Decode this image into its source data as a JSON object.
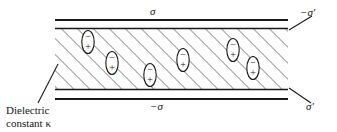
{
  "figure": {
    "background_color": "#ffffff",
    "line_color": "#1a1a1a",
    "hatch_color": "#4a4a4a",
    "labels": {
      "free_charge_top": "σ",
      "free_charge_bottom": "−σ",
      "bound_charge_top": "−σ′",
      "bound_charge_bottom": "σ′"
    },
    "caption": {
      "line1": "Dielectric",
      "line2_prefix": "constant ",
      "line2_symbol": "κ",
      "full": "Dielectric constant κ"
    },
    "slab": {
      "left": 55,
      "right": 288,
      "top": 29,
      "bottom": 89,
      "hatch_angle_deg": 45,
      "hatch_spacing_px": 8
    },
    "plates": {
      "top_plate_y": 20,
      "top_bound_y": 28,
      "bottom_bound_y": 90,
      "bottom_plate_y": 99
    },
    "dipoles": [
      {
        "cx": 88,
        "cy": 42,
        "top_sign": "−",
        "bottom_sign": "+"
      },
      {
        "cx": 112,
        "cy": 63,
        "top_sign": "−",
        "bottom_sign": "+"
      },
      {
        "cx": 150,
        "cy": 75,
        "top_sign": "−",
        "bottom_sign": "+"
      },
      {
        "cx": 183,
        "cy": 60,
        "top_sign": "−",
        "bottom_sign": "+"
      },
      {
        "cx": 233,
        "cy": 50,
        "top_sign": "−",
        "bottom_sign": "+"
      },
      {
        "cx": 253,
        "cy": 68,
        "top_sign": "−",
        "bottom_sign": "+"
      }
    ],
    "leaders": [
      {
        "name": "dielectric-leader",
        "x1": 38,
        "y1": 103,
        "x2": 58,
        "y2": 64
      },
      {
        "name": "bound-top-leader",
        "x1": 289,
        "y1": 30,
        "x2": 312,
        "y2": 16
      },
      {
        "name": "bound-bottom-leader",
        "x1": 289,
        "y1": 88,
        "x2": 311,
        "y2": 103
      }
    ]
  }
}
